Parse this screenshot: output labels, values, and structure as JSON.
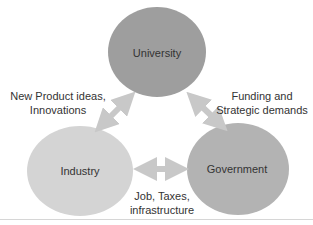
{
  "diagram": {
    "nodes": [
      {
        "id": "university",
        "label": "University",
        "color": "#9e9e9e"
      },
      {
        "id": "industry",
        "label": "Industry",
        "color": "#d4d4d4"
      },
      {
        "id": "government",
        "label": "Government",
        "color": "#b3b3b3"
      }
    ],
    "edges": [
      {
        "from": "industry",
        "to": "university",
        "label_line1": "New Product ideas,",
        "label_line2": "Innovations"
      },
      {
        "from": "government",
        "to": "university",
        "label_line1": "Funding and",
        "label_line2": "Strategic demands"
      },
      {
        "from": "industry",
        "to": "government",
        "label_line1": "Job, Taxes,",
        "label_line2": "infrastructure"
      }
    ],
    "arrow_color": "#c8c8c8"
  }
}
